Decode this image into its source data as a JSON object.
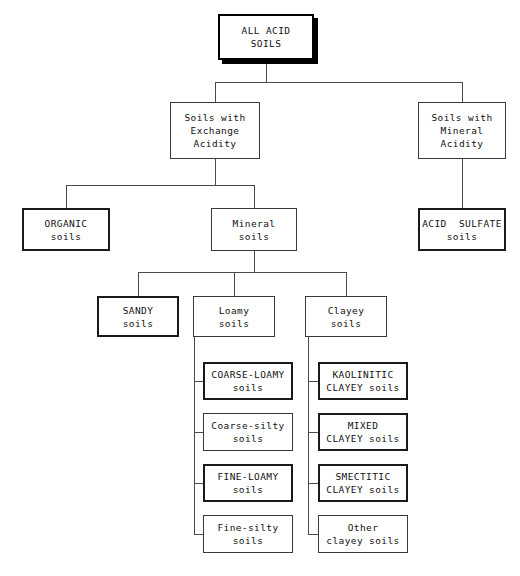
{
  "diagram": {
    "type": "hierarchy-tree",
    "background_color": "#ffffff",
    "line_color": "#4a4a4a",
    "text_color": "#111111",
    "nodes": [
      {
        "id": "all-acid-soils",
        "lines": [
          "ALL ACID",
          "SOILS"
        ],
        "emphasis": "shadow",
        "level": 0,
        "x": 218,
        "y": 14,
        "w": 96,
        "h": 46
      },
      {
        "id": "soils-with-exchange-acidity",
        "lines": [
          "Soils with",
          "Exchange",
          "Acidity"
        ],
        "emphasis": "plain",
        "level": 1,
        "x": 170,
        "y": 102,
        "w": 90,
        "h": 57
      },
      {
        "id": "soils-with-mineral-acidity",
        "lines": [
          "Soils with",
          "Mineral",
          "Acidity"
        ],
        "emphasis": "plain",
        "level": 1,
        "x": 418,
        "y": 102,
        "w": 88,
        "h": 57
      },
      {
        "id": "organic-soils",
        "lines": [
          "ORGANIC",
          "soils"
        ],
        "emphasis": "bold",
        "level": 2,
        "x": 22,
        "y": 208,
        "w": 88,
        "h": 43
      },
      {
        "id": "mineral-soils",
        "lines": [
          "Mineral",
          "soils"
        ],
        "emphasis": "plain",
        "level": 2,
        "x": 211,
        "y": 208,
        "w": 86,
        "h": 43
      },
      {
        "id": "acid-sulfate-soils",
        "lines": [
          "ACID  SULFATE",
          "soils"
        ],
        "emphasis": "bold",
        "level": 2,
        "x": 418,
        "y": 208,
        "w": 88,
        "h": 43
      },
      {
        "id": "sandy-soils",
        "lines": [
          "SANDY",
          "soils"
        ],
        "emphasis": "bold",
        "level": 3,
        "x": 97,
        "y": 296,
        "w": 82,
        "h": 41
      },
      {
        "id": "loamy-soils",
        "lines": [
          "Loamy",
          "soils"
        ],
        "emphasis": "plain",
        "level": 3,
        "x": 193,
        "y": 296,
        "w": 82,
        "h": 41
      },
      {
        "id": "clayey-soils",
        "lines": [
          "Clayey",
          "soils"
        ],
        "emphasis": "plain",
        "level": 3,
        "x": 305,
        "y": 296,
        "w": 82,
        "h": 41
      },
      {
        "id": "coarse-loamy-soils",
        "lines": [
          "COARSE-LOAMY",
          "soils"
        ],
        "emphasis": "bold",
        "level": 4,
        "x": 203,
        "y": 362,
        "w": 90,
        "h": 38
      },
      {
        "id": "coarse-silty-soils",
        "lines": [
          "Coarse-silty",
          "soils"
        ],
        "emphasis": "plain",
        "level": 4,
        "x": 203,
        "y": 413,
        "w": 90,
        "h": 38
      },
      {
        "id": "fine-loamy-soils",
        "lines": [
          "FINE-LOAMY",
          "soils"
        ],
        "emphasis": "bold",
        "level": 4,
        "x": 203,
        "y": 464,
        "w": 90,
        "h": 38
      },
      {
        "id": "fine-silty-soils",
        "lines": [
          "Fine-silty",
          "soils"
        ],
        "emphasis": "plain",
        "level": 4,
        "x": 203,
        "y": 515,
        "w": 90,
        "h": 38
      },
      {
        "id": "kaolinitic-clayey-soils",
        "lines": [
          "KAOLINITIC",
          "CLAYEY soils"
        ],
        "emphasis": "bold",
        "level": 4,
        "x": 318,
        "y": 362,
        "w": 90,
        "h": 38
      },
      {
        "id": "mixed-clayey-soils",
        "lines": [
          "MIXED",
          "CLAYEY soils"
        ],
        "emphasis": "bold",
        "level": 4,
        "x": 318,
        "y": 413,
        "w": 90,
        "h": 38
      },
      {
        "id": "smectitic-clayey-soils",
        "lines": [
          "SMECTITIC",
          "CLAYEY soils"
        ],
        "emphasis": "bold",
        "level": 4,
        "x": 318,
        "y": 464,
        "w": 90,
        "h": 38
      },
      {
        "id": "other-clayey-soils",
        "lines": [
          "Other",
          "clayey soils"
        ],
        "emphasis": "plain",
        "level": 4,
        "x": 318,
        "y": 515,
        "w": 90,
        "h": 38
      }
    ],
    "edges": [
      {
        "id": "root-stem",
        "orient": "v",
        "x": 266,
        "y": 60,
        "len": 22
      },
      {
        "id": "root-bus",
        "orient": "h",
        "x": 215,
        "y": 82,
        "len": 247
      },
      {
        "id": "drop-exchange",
        "orient": "v",
        "x": 215,
        "y": 82,
        "len": 20
      },
      {
        "id": "drop-mineral-acidity",
        "orient": "v",
        "x": 462,
        "y": 82,
        "len": 20
      },
      {
        "id": "exchange-stem",
        "orient": "v",
        "x": 215,
        "y": 159,
        "len": 26
      },
      {
        "id": "exchange-bus",
        "orient": "h",
        "x": 66,
        "y": 185,
        "len": 188
      },
      {
        "id": "drop-organic",
        "orient": "v",
        "x": 66,
        "y": 185,
        "len": 23
      },
      {
        "id": "drop-mineral-soils",
        "orient": "v",
        "x": 254,
        "y": 185,
        "len": 23
      },
      {
        "id": "mineral-acidity-stem",
        "orient": "v",
        "x": 462,
        "y": 159,
        "len": 49
      },
      {
        "id": "mineral-soils-stem",
        "orient": "v",
        "x": 254,
        "y": 251,
        "len": 21
      },
      {
        "id": "mineral-bus",
        "orient": "h",
        "x": 138,
        "y": 272,
        "len": 208
      },
      {
        "id": "drop-sandy",
        "orient": "v",
        "x": 138,
        "y": 272,
        "len": 24
      },
      {
        "id": "drop-loamy",
        "orient": "v",
        "x": 234,
        "y": 272,
        "len": 24
      },
      {
        "id": "drop-clayey",
        "orient": "v",
        "x": 346,
        "y": 272,
        "len": 24
      },
      {
        "id": "loamy-spine",
        "orient": "v",
        "x": 194,
        "y": 337,
        "len": 197
      },
      {
        "id": "loamy-stub-1",
        "orient": "h",
        "x": 194,
        "y": 381,
        "len": 9
      },
      {
        "id": "loamy-stub-2",
        "orient": "h",
        "x": 194,
        "y": 432,
        "len": 9
      },
      {
        "id": "loamy-stub-3",
        "orient": "h",
        "x": 194,
        "y": 483,
        "len": 9
      },
      {
        "id": "loamy-stub-4",
        "orient": "h",
        "x": 194,
        "y": 534,
        "len": 9
      },
      {
        "id": "clayey-spine",
        "orient": "v",
        "x": 308,
        "y": 337,
        "len": 197
      },
      {
        "id": "clayey-stub-1",
        "orient": "h",
        "x": 308,
        "y": 381,
        "len": 10
      },
      {
        "id": "clayey-stub-2",
        "orient": "h",
        "x": 308,
        "y": 432,
        "len": 10
      },
      {
        "id": "clayey-stub-3",
        "orient": "h",
        "x": 308,
        "y": 483,
        "len": 10
      },
      {
        "id": "clayey-stub-4",
        "orient": "h",
        "x": 308,
        "y": 534,
        "len": 10
      }
    ]
  }
}
